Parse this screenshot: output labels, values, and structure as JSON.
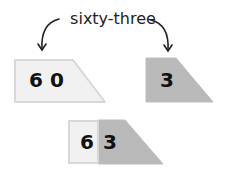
{
  "label": {
    "text": "sixty-three"
  },
  "cards": [
    {
      "name": "tens-card",
      "digits": "6 0",
      "fill": "#f1f1f1"
    },
    {
      "name": "ones-card",
      "digits": "3",
      "fill": "#b9b9b9"
    }
  ],
  "combined": {
    "tens_digit": "6",
    "ones_digit": "3",
    "tens_fill": "#f1f1f1",
    "ones_fill": "#b9b9b9"
  },
  "colors": {
    "stroke": "#d8d8d8",
    "arrow": "#222222"
  }
}
